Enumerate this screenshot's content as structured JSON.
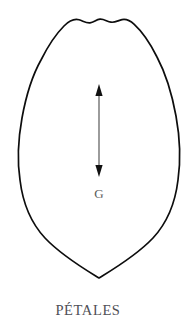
{
  "figure": {
    "caption": "PÉTALES",
    "dimension_label": "G",
    "colors": {
      "background": "#ffffff",
      "outline": "#0d0d0d",
      "arrow_shaft": "#4a4a4a",
      "arrow_head": "#111111",
      "label_text": "#5b5b5b",
      "caption_text": "#4f4f56"
    },
    "shape": {
      "name": "petal-outline",
      "description": "ovate petal with scalloped wavy apex and pointed base",
      "top_y": 18,
      "bottom_tip_x": 99,
      "bottom_tip_y": 278,
      "left_extreme_x": 19,
      "right_extreme_x": 180,
      "widest_y": 140
    },
    "measure_arrow": {
      "name": "length-dimension-arrow",
      "orientation": "vertical",
      "double_headed": true,
      "x": 99,
      "top_y": 85,
      "bottom_y": 176
    },
    "label_position": {
      "x": 99,
      "y": 198
    },
    "caption_position": {
      "x": 88,
      "y": 315
    }
  }
}
